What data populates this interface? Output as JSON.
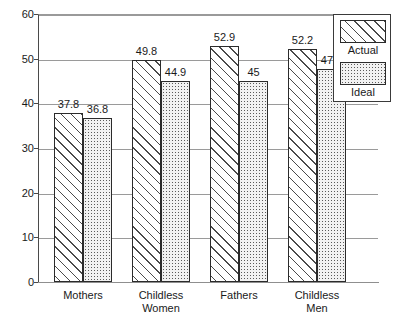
{
  "chart_data": {
    "type": "bar",
    "title": "",
    "subtitle": "",
    "xlabel": "",
    "ylabel": "",
    "categories": [
      "Mothers",
      "Childless\nWomen",
      "Fathers",
      "Childless\nMen"
    ],
    "series": [
      {
        "name": "Actual",
        "pattern": "diagonal-hatch",
        "values": [
          37.8,
          49.8,
          52.9,
          52.2
        ],
        "labels": [
          "37.8",
          "49.8",
          "52.9",
          "52.2"
        ]
      },
      {
        "name": "Ideal",
        "pattern": "dotted",
        "values": [
          36.8,
          44.9,
          45,
          47.6
        ],
        "labels": [
          "36.8",
          "44.9",
          "45",
          "47.6"
        ]
      }
    ],
    "ylim": [
      0,
      60
    ],
    "yticks": [
      0,
      10,
      20,
      30,
      40,
      50,
      60
    ],
    "ytick_labels": [
      "0",
      "10",
      "20",
      "30",
      "40",
      "50",
      "60"
    ],
    "grid": true,
    "grid_axis": "y",
    "legend_position": "top-right",
    "legend_entries": [
      "Actual",
      "Ideal"
    ],
    "colors": {
      "bar_outline": "#2b2b2b",
      "hatch": "#4a4a4a",
      "dot": "#5a5a5a",
      "ideal_fill": "#f2f2f2",
      "gridline": "#9a9a9a",
      "axis": "#4a4a4a",
      "text": "#1a1a1a",
      "background": "#ffffff"
    }
  }
}
